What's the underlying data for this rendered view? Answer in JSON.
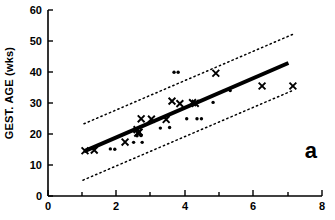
{
  "chart_data": {
    "type": "scatter",
    "title": "",
    "panel_label": "a",
    "xlabel": "",
    "ylabel": "GEST. AGE (wks)",
    "xlim": [
      0,
      8
    ],
    "ylim": [
      0,
      60
    ],
    "xticks": [
      0,
      2,
      4,
      6,
      8
    ],
    "xtick_labels": [
      "0",
      "2",
      "4",
      "6",
      "8"
    ],
    "xminor_ticks": [
      1,
      3,
      5,
      7
    ],
    "yticks": [
      0,
      10,
      20,
      30,
      40,
      50,
      60
    ],
    "ytick_labels": [
      "0",
      "10",
      "20",
      "30",
      "40",
      "50",
      "60"
    ],
    "grid": false,
    "legend": null,
    "series": [
      {
        "name": "cross-markers",
        "marker": "x",
        "color": "#000000",
        "points": [
          [
            1.08,
            14.6
          ],
          [
            1.35,
            14.8
          ],
          [
            2.25,
            17.4
          ],
          [
            2.6,
            21.4
          ],
          [
            2.62,
            20.3
          ],
          [
            2.66,
            20.6
          ],
          [
            2.72,
            24.9
          ],
          [
            3.02,
            24.8
          ],
          [
            3.45,
            24.7
          ],
          [
            3.62,
            30.6
          ],
          [
            3.85,
            29.8
          ],
          [
            4.22,
            30.1
          ],
          [
            4.3,
            29.9
          ],
          [
            4.9,
            39.6
          ],
          [
            6.25,
            35.5
          ],
          [
            7.15,
            35.5
          ]
        ]
      },
      {
        "name": "dot-markers",
        "marker": "o",
        "color": "#000000",
        "points": [
          [
            1.82,
            15.2
          ],
          [
            1.95,
            15.1
          ],
          [
            2.5,
            17.3
          ],
          [
            2.75,
            17.3
          ],
          [
            2.6,
            19.4
          ],
          [
            2.72,
            19.5
          ],
          [
            3.28,
            21.9
          ],
          [
            3.55,
            22.1
          ],
          [
            3.68,
            39.9
          ],
          [
            3.8,
            39.9
          ],
          [
            4.05,
            24.9
          ],
          [
            4.35,
            24.9
          ],
          [
            4.48,
            24.9
          ],
          [
            4.82,
            30.2
          ],
          [
            5.32,
            34.0
          ]
        ]
      }
    ],
    "regression_line": {
      "name": "fitted-regression-line",
      "style": "solid",
      "width": 4,
      "color": "#000000",
      "x_start": 1.05,
      "y_start": 14.4,
      "x_end": 7.02,
      "y_end": 42.9
    },
    "confidence_bands": [
      {
        "name": "upper-confidence-band",
        "style": "dotted",
        "color": "#000000",
        "x_start": 1.05,
        "y_start": 23.3,
        "x_end": 7.18,
        "y_end": 52.3
      },
      {
        "name": "lower-confidence-band",
        "style": "dotted",
        "color": "#000000",
        "x_start": 1.02,
        "y_start": 5.1,
        "x_end": 7.18,
        "y_end": 34.2
      }
    ]
  }
}
